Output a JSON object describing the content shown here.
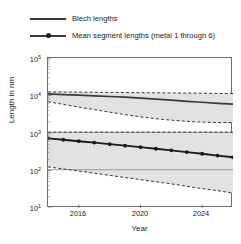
{
  "chart_data": {
    "type": "line",
    "title": "",
    "xlabel": "Year",
    "ylabel": "Length in nm",
    "xlim": [
      2014,
      2026
    ],
    "ylim": [
      10,
      100000
    ],
    "yscale": "log",
    "grid": false,
    "legend_position": "above-plot",
    "xticks": [
      2016,
      2020,
      2024
    ],
    "xticklabels": [
      "2016",
      "2020",
      "2024"
    ],
    "yticks": [
      10,
      100,
      1000,
      10000,
      100000
    ],
    "yticklabels": [
      "10¹",
      "10²",
      "10³",
      "10⁴",
      "10⁵"
    ],
    "series": [
      {
        "name": "Blech lengths",
        "style": "solid",
        "marker": "none",
        "color": "#3a3a3a",
        "x": [
          2014,
          2015,
          2016,
          2017,
          2018,
          2019,
          2020,
          2021,
          2022,
          2023,
          2024,
          2025,
          2026
        ],
        "values": [
          11000,
          10600,
          10200,
          9800,
          9400,
          9000,
          8500,
          8000,
          7500,
          7000,
          6600,
          6200,
          5900
        ],
        "band": {
          "upper": [
            12500,
            12400,
            12300,
            12200,
            12100,
            12000,
            11900,
            11800,
            11700,
            11600,
            11500,
            11400,
            11300
          ],
          "lower": [
            6800,
            5800,
            4900,
            4200,
            3600,
            3100,
            2700,
            2400,
            2200,
            2050,
            1950,
            1900,
            1900
          ]
        }
      },
      {
        "name": "Mean segment lengths (metal 1 through 6)",
        "style": "solid",
        "marker": "circle",
        "color": "#1a1a1a",
        "x": [
          2014,
          2015,
          2016,
          2017,
          2018,
          2019,
          2020,
          2021,
          2022,
          2023,
          2024,
          2025,
          2026
        ],
        "values": [
          720,
          660,
          605,
          555,
          505,
          460,
          420,
          380,
          345,
          310,
          280,
          250,
          225
        ],
        "band": {
          "upper": [
            1050,
            1050,
            1050,
            1050,
            1050,
            1050,
            1050,
            1050,
            1050,
            1050,
            1050,
            1050,
            1050
          ],
          "lower": [
            125,
            110,
            97,
            85,
            74,
            65,
            57,
            50,
            44,
            38,
            33,
            29,
            25
          ]
        }
      }
    ],
    "band_fill_color": "#e2e2e2",
    "band_edge_style": "dashed",
    "reference_lines": [
      1050,
      105
    ]
  },
  "legend": {
    "items": [
      {
        "label": "Blech lengths",
        "marker": "none"
      },
      {
        "label": "Mean segment lengths (metal 1 through 6)",
        "marker": "circle"
      }
    ]
  },
  "axes": {
    "x_title": "Year",
    "y_title": "Length in nm",
    "x_ticks": [
      "2016",
      "2020",
      "2024"
    ],
    "y_ticks": [
      "10⁵",
      "10⁴",
      "10³",
      "10²",
      "10¹"
    ]
  }
}
